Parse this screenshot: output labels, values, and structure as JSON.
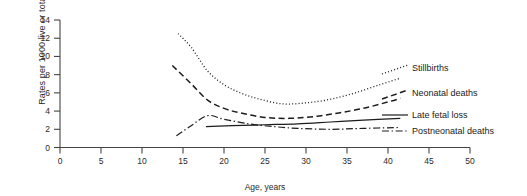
{
  "chart_data": {
    "type": "line",
    "title": "",
    "xlabel": "Age, years",
    "ylabel": "Rates per 1000 live or total births",
    "xlim": [
      0,
      50
    ],
    "ylim": [
      0,
      14
    ],
    "xticks": [
      0,
      5,
      10,
      15,
      20,
      25,
      30,
      35,
      40,
      45,
      50
    ],
    "yticks": [
      0,
      2,
      4,
      6,
      8,
      10,
      12,
      14
    ],
    "grid": false,
    "legend_position": "right-inline",
    "series": [
      {
        "name": "Stillbirths",
        "style": "dotted",
        "x": [
          14.4,
          16.0,
          18.0,
          20.0,
          22.0,
          24.0,
          27.0,
          30.0,
          33.0,
          36.0,
          39.0,
          41.5
        ],
        "values": [
          12.5,
          11.0,
          8.4,
          6.9,
          6.0,
          5.4,
          4.8,
          4.9,
          5.3,
          6.0,
          6.9,
          7.6
        ]
      },
      {
        "name": "Neonatal deaths",
        "style": "dashed",
        "x": [
          13.7,
          16.0,
          18.0,
          20.0,
          22.0,
          25.0,
          28.0,
          31.0,
          34.0,
          37.0,
          40.0,
          41.5
        ],
        "values": [
          9.0,
          7.0,
          5.2,
          4.3,
          3.8,
          3.3,
          3.2,
          3.4,
          3.8,
          4.3,
          5.0,
          5.4
        ]
      },
      {
        "name": "Late fetal loss",
        "style": "solid",
        "x": [
          17.8,
          21.0,
          25.0,
          29.0,
          33.0,
          37.0,
          41.5
        ],
        "values": [
          2.3,
          2.4,
          2.5,
          2.6,
          2.8,
          3.0,
          3.2
        ]
      },
      {
        "name": "Postneonatal deaths",
        "style": "dashdot",
        "x": [
          14.2,
          16.0,
          18.0,
          20.0,
          23.0,
          26.0,
          29.0,
          33.0,
          37.0,
          41.5
        ],
        "values": [
          1.3,
          2.4,
          3.5,
          3.1,
          2.6,
          2.3,
          2.1,
          2.0,
          2.1,
          2.2
        ]
      }
    ]
  },
  "legend": {
    "items": [
      {
        "label": "Stillbirths"
      },
      {
        "label": "Neonatal deaths"
      },
      {
        "label": "Late fetal loss"
      },
      {
        "label": "Postneonatal deaths"
      }
    ]
  },
  "axes": {
    "x_title": "Age, years",
    "y_title": "Rates per 1000 live or total births",
    "x_tick_labels": [
      "0",
      "5",
      "10",
      "15",
      "20",
      "25",
      "30",
      "35",
      "40",
      "45",
      "50"
    ],
    "y_tick_labels": [
      "0",
      "2",
      "4",
      "6",
      "8",
      "10",
      "12",
      "14"
    ]
  }
}
